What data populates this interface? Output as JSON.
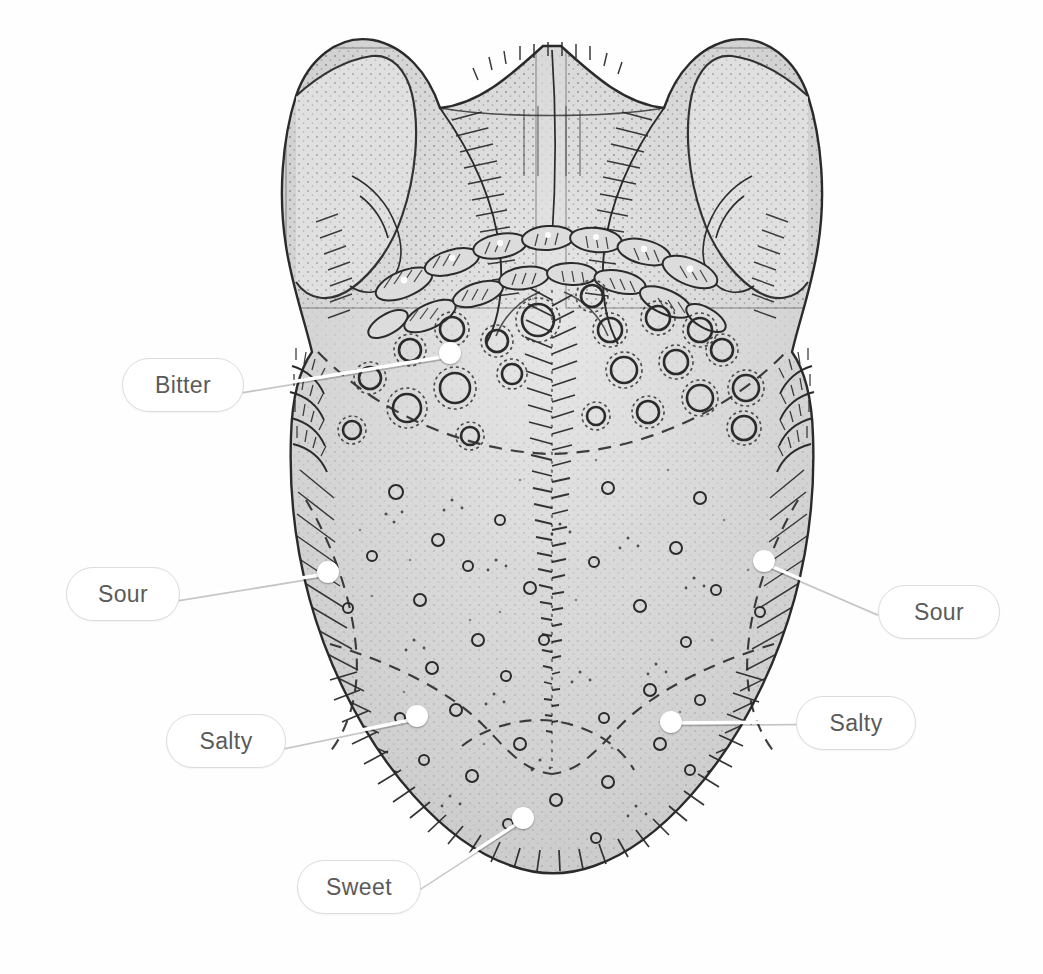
{
  "figure": {
    "background_color": "#fefefe",
    "ink_color": "#2b2b2b",
    "tissue_fill": "#d9d9d9",
    "label_text_color": "#5a5a5a",
    "label_border_color": "#dcdcdc",
    "marker_color": "#ffffff"
  },
  "labels": [
    {
      "id": "bitter",
      "text": "Bitter",
      "pill": {
        "x": 122,
        "y": 358,
        "w": 120,
        "h": 52
      },
      "marker": {
        "x": 450,
        "y": 353,
        "r": 11
      },
      "leader": {
        "x1": 243,
        "y1": 390,
        "x2": 448,
        "y2": 356
      }
    },
    {
      "id": "sour-left",
      "text": "Sour",
      "pill": {
        "x": 66,
        "y": 567,
        "w": 112,
        "h": 52
      },
      "marker": {
        "x": 328,
        "y": 572,
        "r": 11
      },
      "leader": {
        "x1": 179,
        "y1": 598,
        "x2": 326,
        "y2": 574
      }
    },
    {
      "id": "sour-right",
      "text": "Sour",
      "pill": {
        "x": 878,
        "y": 585,
        "w": 120,
        "h": 52
      },
      "marker": {
        "x": 764,
        "y": 561,
        "r": 11
      },
      "leader": {
        "x1": 877,
        "y1": 612,
        "x2": 766,
        "y2": 564
      }
    },
    {
      "id": "salty-left",
      "text": "Salty",
      "pill": {
        "x": 166,
        "y": 714,
        "w": 118,
        "h": 52
      },
      "marker": {
        "x": 417,
        "y": 716,
        "r": 11
      },
      "leader": {
        "x1": 285,
        "y1": 746,
        "x2": 415,
        "y2": 719
      }
    },
    {
      "id": "salty-right",
      "text": "Salty",
      "pill": {
        "x": 796,
        "y": 696,
        "w": 118,
        "h": 52
      },
      "marker": {
        "x": 671,
        "y": 722,
        "r": 11
      },
      "leader": {
        "x1": 795,
        "y1": 722,
        "x2": 673,
        "y2": 723
      }
    },
    {
      "id": "sweet",
      "text": "Sweet",
      "pill": {
        "x": 297,
        "y": 860,
        "w": 122,
        "h": 52
      },
      "marker": {
        "x": 523,
        "y": 818,
        "r": 11
      },
      "leader": {
        "x1": 418,
        "y1": 888,
        "x2": 521,
        "y2": 821
      }
    }
  ],
  "taste_zones": [
    {
      "name": "Bitter",
      "region": "posterior-dorsum-circumvallate-row"
    },
    {
      "name": "Sour",
      "region": "lateral-margins-mid"
    },
    {
      "name": "Salty",
      "region": "lateral-margins-anterior"
    },
    {
      "name": "Sweet",
      "region": "apex-tip"
    }
  ],
  "anatomy_features": [
    "epiglottis-wings",
    "valleculae",
    "lingual-tonsil-nodules",
    "circumvallate-papillae",
    "foliate-papillae",
    "median-sulcus",
    "fungiform-papillae",
    "filiform-papillae-margin"
  ]
}
